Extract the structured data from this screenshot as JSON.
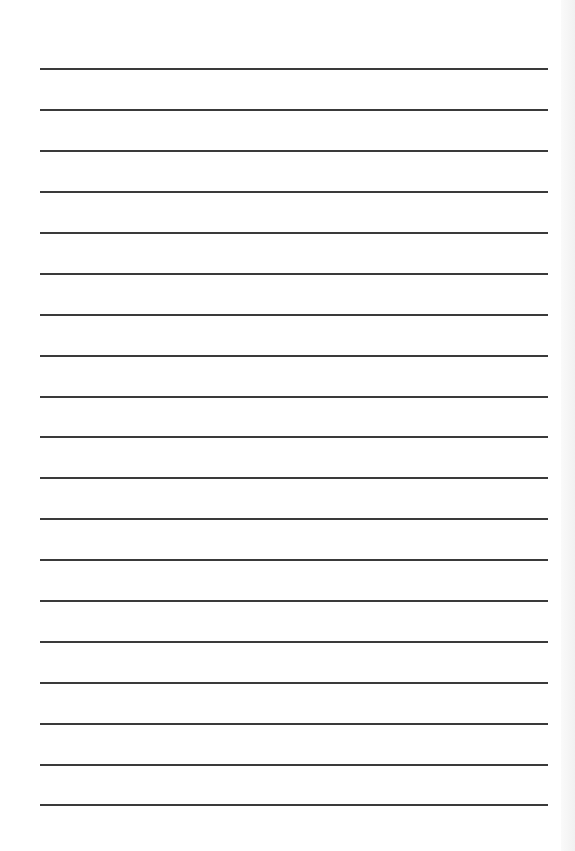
{
  "page": {
    "type": "lined-paper",
    "line_count": 19,
    "line_color": "#3a3a3a",
    "background": "#ffffff",
    "lines_y": [
      68,
      109,
      150,
      191,
      232,
      273,
      314,
      355,
      396,
      436,
      477,
      518,
      559,
      600,
      641,
      682,
      723,
      764,
      804
    ]
  }
}
